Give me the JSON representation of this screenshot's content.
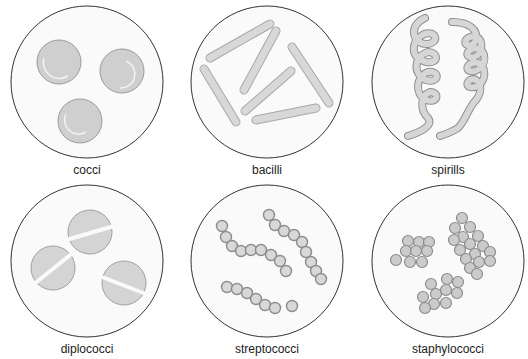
{
  "diagram": {
    "panels": [
      {
        "id": "cocci",
        "label": "cocci"
      },
      {
        "id": "bacilli",
        "label": "bacilli"
      },
      {
        "id": "spirills",
        "label": "spirills"
      },
      {
        "id": "diplococci",
        "label": "diplococci"
      },
      {
        "id": "streptococci",
        "label": "streptococci"
      },
      {
        "id": "staphylococci",
        "label": "staphylococci"
      }
    ],
    "colors": {
      "circle_fill": "#fafafa",
      "circle_stroke": "#333333",
      "cell_fill": "#cfcfcf",
      "cell_stroke": "#9a9a9a"
    }
  }
}
